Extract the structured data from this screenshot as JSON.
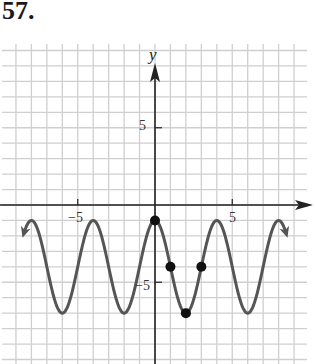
{
  "problem_number": "57.",
  "chart_data": {
    "type": "line",
    "title": "",
    "xlabel": "",
    "ylabel": "y",
    "xlim": [
      -10,
      10
    ],
    "ylim": [
      -10,
      10
    ],
    "x_ticks_labeled": [
      -5,
      5
    ],
    "y_ticks_labeled": [
      5,
      -5
    ],
    "grid": true,
    "function": "y = 3cos(pi x / 2) - 4",
    "curve_domain": [
      -8.5,
      8.5
    ],
    "amplitude": 3,
    "period": 4,
    "midline": -4,
    "maxima": [
      [
        -4,
        -1
      ],
      [
        0,
        -1
      ],
      [
        4,
        -1
      ]
    ],
    "minima": [
      [
        -6,
        -7
      ],
      [
        -2,
        -7
      ],
      [
        2,
        -7
      ],
      [
        6,
        -7
      ]
    ],
    "marked_points": [
      [
        0,
        -1
      ],
      [
        1,
        -4
      ],
      [
        2,
        -7
      ],
      [
        3,
        -4
      ]
    ],
    "colors": {
      "curve": "#555555",
      "axes": "#222222",
      "grid": "#cfcfcf",
      "points": "#111111"
    }
  },
  "labels": {
    "x_neg5": "−5",
    "x_pos5": "5",
    "y_pos5": "5",
    "y_neg5": "−5",
    "y_axis": "y"
  }
}
